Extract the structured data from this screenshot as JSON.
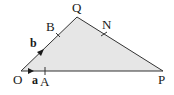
{
  "diagram": {
    "type": "triangle-vectors",
    "fill_color": "#e6e6e6",
    "stroke_color": "#333333",
    "vertices": {
      "O": {
        "label": "O"
      },
      "Q": {
        "label": "Q"
      },
      "P": {
        "label": "P"
      }
    },
    "points": {
      "A": {
        "label": "A",
        "on": "OP"
      },
      "B": {
        "label": "B",
        "on": "OQ"
      },
      "N": {
        "label": "N",
        "on": "QP"
      }
    },
    "vectors": {
      "a": {
        "label": "a",
        "along": "OA"
      },
      "b": {
        "label": "b",
        "along": "OB"
      }
    }
  }
}
